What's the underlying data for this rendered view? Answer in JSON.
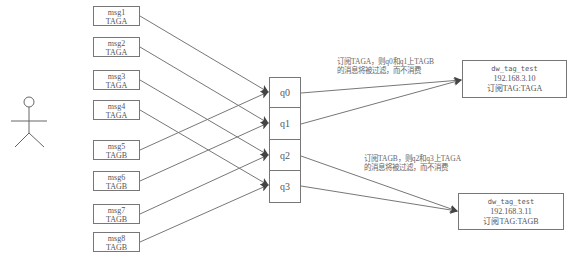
{
  "actor": {
    "label": ""
  },
  "messages": [
    {
      "name": "msg1",
      "tag": "TAGA",
      "top": 6,
      "target": 0
    },
    {
      "name": "msg2",
      "tag": "TAGA",
      "top": 37,
      "target": 1
    },
    {
      "name": "msg3",
      "tag": "TAGA",
      "top": 70,
      "target": 2
    },
    {
      "name": "msg4",
      "tag": "TAGA",
      "top": 100,
      "target": 3
    },
    {
      "name": "msg5",
      "tag": "TAGB",
      "top": 140,
      "target": 0
    },
    {
      "name": "msg6",
      "tag": "TAGB",
      "top": 171,
      "target": 1
    },
    {
      "name": "msg7",
      "tag": "TAGB",
      "top": 204,
      "target": 2
    },
    {
      "name": "msg8",
      "tag": "TAGB",
      "top": 232,
      "target": 3
    }
  ],
  "queues": [
    {
      "label": "q0",
      "consumer": 0
    },
    {
      "label": "q1",
      "consumer": 0
    },
    {
      "label": "q2",
      "consumer": 1
    },
    {
      "label": "q3",
      "consumer": 1
    }
  ],
  "consumers": [
    {
      "name": "dw_tag_test",
      "ip": "192.168.3.10",
      "subscription": "订阅TAG:TAGA"
    },
    {
      "name": "dw_tag_test",
      "ip": "192.168.3.11",
      "subscription": "订阅TAG:TAGB"
    }
  ],
  "notes": [
    {
      "line1": "订阅TAGA，则q0和q1上TAGB",
      "line2": "的消息将被过滤，而不消费"
    },
    {
      "line1": "订阅TAGB，则q2和q3上TAGA",
      "line2": "的消息将被过滤，而不消费"
    }
  ],
  "colors": {
    "line": "#777777",
    "arrow": "#444444",
    "text": "#555555"
  }
}
